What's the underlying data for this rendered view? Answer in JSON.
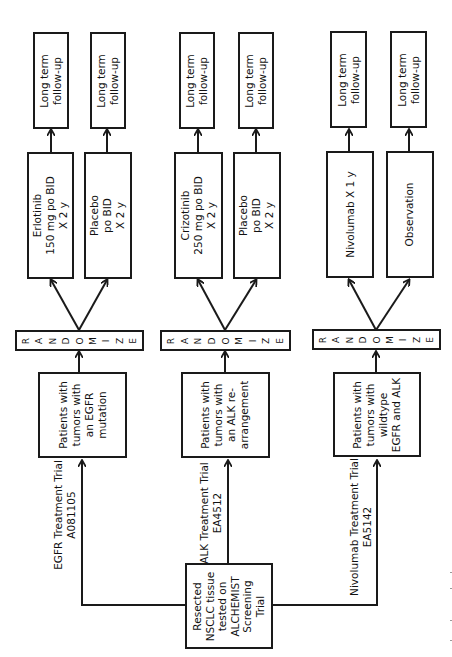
{
  "screening": {
    "lines": [
      "Resected",
      "NSCLC tissue",
      "tested on",
      "ALCHEMIST",
      "Screening",
      "Trial"
    ]
  },
  "trials": [
    {
      "id": "egfr",
      "label_lines": [
        "EGFR Treatment Trial",
        "A081105"
      ],
      "population_lines": [
        "Patients with",
        "tumors with",
        "an EGFR",
        "mutation"
      ],
      "randomize_letters": [
        "R",
        "A",
        "N",
        "D",
        "O",
        "M",
        "I",
        "Z",
        "E"
      ],
      "arms": [
        {
          "lines": [
            "Erlotinib",
            "150 mg po BID",
            "X 2 y"
          ],
          "followup_lines": [
            "Long term",
            "follow-up"
          ]
        },
        {
          "lines": [
            "Placebo",
            "po BID",
            "X 2 y"
          ],
          "followup_lines": [
            "Long term",
            "follow-up"
          ]
        }
      ]
    },
    {
      "id": "alk",
      "label_lines": [
        "ALK Treatment Trial",
        "EA4512"
      ],
      "population_lines": [
        "Patients with",
        "tumors with",
        "an ALK re-",
        "arrangement"
      ],
      "randomize_letters": [
        "R",
        "A",
        "N",
        "D",
        "O",
        "M",
        "I",
        "Z",
        "E"
      ],
      "arms": [
        {
          "lines": [
            "Crizotinib",
            "250 mg po BID",
            "X 2 y"
          ],
          "followup_lines": [
            "Long term",
            "follow-up"
          ]
        },
        {
          "lines": [
            "Placebo",
            "po BID",
            "X 2 y"
          ],
          "followup_lines": [
            "Long term",
            "follow-up"
          ]
        }
      ]
    },
    {
      "id": "nivolumab",
      "label_lines": [
        "Nivolumab Treatment Trial",
        "EA5142"
      ],
      "population_lines": [
        "Patients with",
        "tumors with",
        "wildtype",
        "EGFR and ALK"
      ],
      "randomize_letters": [
        "R",
        "A",
        "N",
        "D",
        "O",
        "M",
        "I",
        "Z",
        "E"
      ],
      "arms": [
        {
          "lines": [
            "Nivolumab X 1 y"
          ],
          "followup_lines": [
            "Long term",
            "follow-up"
          ]
        },
        {
          "lines": [
            "Observation"
          ],
          "followup_lines": [
            "Long term",
            "follow-up"
          ]
        }
      ]
    }
  ]
}
